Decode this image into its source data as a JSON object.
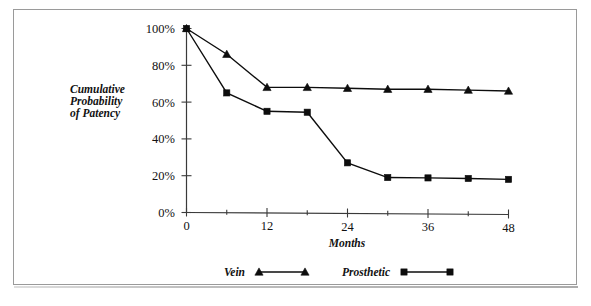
{
  "chart_data": {
    "type": "line",
    "title": "",
    "xlabel": "Months",
    "ylabel": "Cumulative Probability of Patency",
    "ylabel_lines": [
      "Cumulative",
      "Probability",
      "of Patency"
    ],
    "x": [
      0,
      6,
      12,
      18,
      24,
      30,
      36,
      42,
      48
    ],
    "xlim": [
      0,
      48
    ],
    "ylim": [
      0,
      100
    ],
    "grid": false,
    "legend_position": "below-axis-center",
    "x_major_ticks": [
      0,
      12,
      24,
      36,
      48
    ],
    "x_major_tick_labels": [
      "0",
      "12",
      "24",
      "36",
      "48"
    ],
    "x_minor_ticks": [
      6,
      18,
      30,
      42
    ],
    "y_ticks": [
      0,
      20,
      40,
      60,
      80,
      100
    ],
    "y_tick_labels": [
      "0%",
      "20%",
      "40%",
      "60%",
      "80%",
      "100%"
    ],
    "series": [
      {
        "name": "Vein",
        "marker": "triangle",
        "color": "#0d0d0d",
        "values": [
          100,
          86,
          68,
          68,
          67.5,
          67,
          67,
          66.5,
          66
        ]
      },
      {
        "name": "Prosthetic",
        "marker": "square",
        "color": "#0d0d0d",
        "values": [
          100,
          65,
          55,
          54.5,
          27,
          19,
          18.8,
          18.5,
          18
        ]
      }
    ]
  },
  "legend": {
    "entries": [
      {
        "label": "Vein",
        "marker": "triangle"
      },
      {
        "label": "Prosthetic",
        "marker": "square"
      }
    ]
  },
  "colors": {
    "ink": "#0d0d0d",
    "axis": "#3a3a3a",
    "page_border": "#9a9a9a",
    "background": "#ffffff"
  }
}
